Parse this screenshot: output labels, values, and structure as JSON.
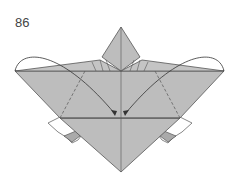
{
  "diagram": {
    "step_number": "86",
    "paper_color": "#bdbdbd",
    "line_color": "#555555",
    "arrow_color": "#333333"
  }
}
